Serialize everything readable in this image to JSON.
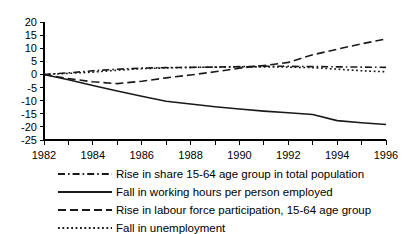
{
  "chart_data": {
    "type": "line",
    "title": "",
    "subtitle": "",
    "xlabel": "",
    "ylabel": "",
    "xlim": [
      1982,
      1996
    ],
    "ylim": [
      -25,
      20
    ],
    "yticks": [
      20,
      15,
      10,
      5,
      0,
      -5,
      -10,
      -15,
      -20,
      -25
    ],
    "ytick_labels": [
      "20",
      "15",
      "10",
      "5",
      "0",
      "-5",
      "-10",
      "-15",
      "-20",
      "-25"
    ],
    "xticks": [
      1982,
      1983,
      1984,
      1985,
      1986,
      1987,
      1988,
      1989,
      1990,
      1991,
      1992,
      1993,
      1994,
      1995,
      1996
    ],
    "xtick_labels": [
      "1982",
      "",
      "1984",
      "",
      "1986",
      "",
      "1988",
      "",
      "1990",
      "",
      "1992",
      "",
      "1994",
      "",
      "1996"
    ],
    "xtick_labels_shown": [
      "1982",
      "1984",
      "1986",
      "1988",
      "1990",
      "1992",
      "1994",
      "1996"
    ],
    "grid": false,
    "legend_position": "below",
    "x": [
      1982,
      1983,
      1984,
      1985,
      1986,
      1987,
      1988,
      1989,
      1990,
      1991,
      1992,
      1993,
      1994,
      1995,
      1996
    ],
    "series": [
      {
        "name": "Rise in share 15-64 age group in total population",
        "style": "dash-dot",
        "color": "#1a1a1a",
        "values": [
          0.0,
          0.6,
          1.4,
          2.0,
          2.4,
          2.6,
          2.7,
          2.8,
          3.0,
          3.1,
          3.1,
          3.0,
          2.9,
          2.8,
          2.7
        ]
      },
      {
        "name": "Fall in working hours per person employed",
        "style": "solid",
        "color": "#1a1a1a",
        "values": [
          0.0,
          -2.0,
          -4.2,
          -6.3,
          -8.3,
          -10.2,
          -11.3,
          -12.3,
          -13.2,
          -14.0,
          -14.6,
          -15.3,
          -17.6,
          -18.4,
          -19.1
        ]
      },
      {
        "name": "Rise in labour force participation, 15-64 age group",
        "style": "dashed",
        "color": "#1a1a1a",
        "values": [
          0.0,
          -1.6,
          -2.8,
          -3.5,
          -2.6,
          -1.3,
          -0.2,
          1.0,
          2.4,
          3.4,
          4.6,
          7.5,
          9.6,
          11.7,
          13.5
        ]
      },
      {
        "name": "Fall in unemployment",
        "style": "dotted",
        "color": "#1a1a1a",
        "values": [
          0.0,
          0.4,
          0.9,
          1.6,
          2.2,
          2.5,
          2.7,
          2.8,
          2.9,
          2.9,
          2.8,
          2.6,
          2.0,
          1.4,
          1.0
        ]
      }
    ],
    "legend": [
      {
        "label": "Rise in share 15-64 age group in total population",
        "style": "dash-dot"
      },
      {
        "label": "Fall in working hours per person employed",
        "style": "solid"
      },
      {
        "label": "Rise in labour force participation, 15-64 age group",
        "style": "dashed"
      },
      {
        "label": "Fall in unemployment",
        "style": "dotted"
      }
    ]
  }
}
